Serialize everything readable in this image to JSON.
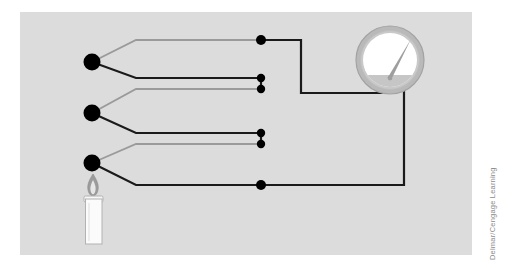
{
  "figure": {
    "background_color": "#ffffff",
    "panel_color": "#dcdcdc",
    "panel": {
      "x": 20,
      "y": 12,
      "width": 452,
      "height": 243
    }
  },
  "credit": {
    "text": "Delmar/Cengage Learning",
    "color": "#8a8a8a",
    "orientation": "vertical"
  },
  "colors": {
    "wire_dark": "#1a1a1a",
    "wire_light": "#9a9a9a",
    "junction": "#000000",
    "meter_ring": "#b4b4b4",
    "meter_ring_edge": "#9a9a9a",
    "meter_face": "#ffffff",
    "meter_face_band": "#c8c8c8",
    "needle": "#9a9a9a",
    "candle_body": "#fbfbfb",
    "candle_outline": "#b0b0b0",
    "flame_outer": "#8f8f8f",
    "flame_inner": "#e8e8e8"
  },
  "junctions": [
    {
      "name": "thermocouple-junction-top",
      "x": 92,
      "y": 62
    },
    {
      "name": "thermocouple-junction-middle",
      "x": 92,
      "y": 113
    },
    {
      "name": "thermocouple-junction-bottom",
      "x": 92,
      "y": 163
    },
    {
      "name": "terminal-top",
      "x": 261,
      "y": 40
    },
    {
      "name": "terminal-pair-1-upper",
      "x": 261,
      "y": 78
    },
    {
      "name": "terminal-pair-1-lower",
      "x": 261,
      "y": 89
    },
    {
      "name": "terminal-pair-2-upper",
      "x": 261,
      "y": 133
    },
    {
      "name": "terminal-pair-2-lower",
      "x": 261,
      "y": 144
    },
    {
      "name": "terminal-bottom",
      "x": 261,
      "y": 185
    }
  ],
  "wires": [
    {
      "name": "wire-light-1",
      "color": "light",
      "points": "92,62 136,40 261,40"
    },
    {
      "name": "wire-dark-1",
      "color": "dark",
      "points": "92,62 136,78 261,78"
    },
    {
      "name": "wire-light-2",
      "color": "light",
      "points": "92,113 136,89 261,89"
    },
    {
      "name": "wire-dark-2",
      "color": "dark",
      "points": "92,113 136,133 261,133"
    },
    {
      "name": "wire-light-3",
      "color": "light",
      "points": "92,163 136,144 261,144"
    },
    {
      "name": "wire-dark-3",
      "color": "dark",
      "points": "92,163 136,185 261,185"
    },
    {
      "name": "wire-link-pair-1",
      "color": "dark",
      "points": "261,78 261,89"
    },
    {
      "name": "wire-link-pair-2",
      "color": "dark",
      "points": "261,133 261,144"
    },
    {
      "name": "wire-meter-left",
      "color": "dark",
      "points": "261,40 301,40 301,93 386,93 386,78"
    },
    {
      "name": "wire-meter-right",
      "color": "dark",
      "points": "261,185 404,185 404,78"
    }
  ],
  "meter": {
    "name": "temperature-meter",
    "center_x": 390,
    "center_y": 60,
    "outer_radius": 35,
    "ring_width": 5,
    "needle_angle_deg": -55,
    "needle_length": 26,
    "label": "meter"
  },
  "candle": {
    "name": "candle",
    "body": {
      "x": 85,
      "y": 198,
      "width": 17,
      "height": 46
    },
    "rim": {
      "x": 84,
      "y": 196,
      "width": 19,
      "height": 6
    },
    "wick": {
      "x": 93,
      "y": 190,
      "height": 7
    },
    "flame": {
      "cx": 93,
      "cy": 185,
      "rx": 5,
      "ry": 11
    }
  }
}
